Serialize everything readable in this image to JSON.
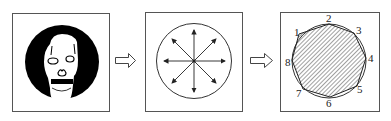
{
  "diagram": {
    "panels": [
      {
        "id": "input-image",
        "description": "face in black circle"
      },
      {
        "id": "radial-directions",
        "description": "circle with 8 radial arrows from center"
      },
      {
        "id": "octagon-approximation",
        "description": "hatched polygon inscribed in circle with 8 numbered vertices"
      }
    ],
    "arrows": [
      "right-arrow",
      "right-arrow"
    ],
    "vertex_labels": [
      "1",
      "2",
      "3",
      "4",
      "5",
      "6",
      "7",
      "8"
    ],
    "colors": {
      "stroke": "#333333",
      "fill_dark": "#000000",
      "background": "#ffffff"
    }
  }
}
